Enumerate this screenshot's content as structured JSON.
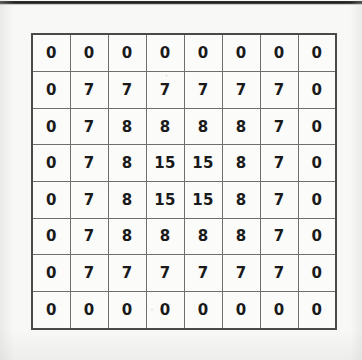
{
  "page": {
    "background_color": "#f8f8f6",
    "top_rule_color": "#1c1c1c"
  },
  "grid": {
    "rows": 8,
    "columns": 8,
    "border_color": "#6f6f6f",
    "outer_border_color": "#4a4a4a",
    "cell_background": "#fbfbfa",
    "text_color": "#1a1a1a",
    "values": [
      [
        "0",
        "0",
        "0",
        "0",
        "0",
        "0",
        "0",
        "0"
      ],
      [
        "0",
        "7",
        "7",
        "7",
        "7",
        "7",
        "7",
        "0"
      ],
      [
        "0",
        "7",
        "8",
        "8",
        "8",
        "8",
        "7",
        "0"
      ],
      [
        "0",
        "7",
        "8",
        "15",
        "15",
        "8",
        "7",
        "0"
      ],
      [
        "0",
        "7",
        "8",
        "15",
        "15",
        "8",
        "7",
        "0"
      ],
      [
        "0",
        "7",
        "8",
        "8",
        "8",
        "8",
        "7",
        "0"
      ],
      [
        "0",
        "7",
        "7",
        "7",
        "7",
        "7",
        "7",
        "0"
      ],
      [
        "0",
        "0",
        "0",
        "0",
        "0",
        "0",
        "0",
        "0"
      ]
    ]
  },
  "chart_data": {
    "type": "heatmap",
    "title": "",
    "xlabel": "",
    "ylabel": "",
    "rows": 8,
    "columns": 8,
    "categories_x": [
      "1",
      "2",
      "3",
      "4",
      "5",
      "6",
      "7",
      "8"
    ],
    "categories_y": [
      "1",
      "2",
      "3",
      "4",
      "5",
      "6",
      "7",
      "8"
    ],
    "values": [
      [
        0,
        0,
        0,
        0,
        0,
        0,
        0,
        0
      ],
      [
        0,
        7,
        7,
        7,
        7,
        7,
        7,
        0
      ],
      [
        0,
        7,
        8,
        8,
        8,
        8,
        7,
        0
      ],
      [
        0,
        7,
        8,
        15,
        15,
        8,
        7,
        0
      ],
      [
        0,
        7,
        8,
        15,
        15,
        8,
        7,
        0
      ],
      [
        0,
        7,
        8,
        8,
        8,
        8,
        7,
        0
      ],
      [
        0,
        7,
        7,
        7,
        7,
        7,
        7,
        0
      ],
      [
        0,
        0,
        0,
        0,
        0,
        0,
        0,
        0
      ]
    ],
    "distinct_values": [
      0,
      7,
      8,
      15
    ],
    "min": 0,
    "max": 15,
    "grid": true,
    "legend": "none",
    "annotations": "Each cell is labelled with its numeric value; the matrix is symmetric with concentric rings of 0, 7, 8 and a 2x2 core of 15."
  }
}
